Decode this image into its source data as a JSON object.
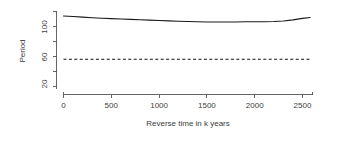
{
  "chart_data": {
    "type": "line",
    "title": "",
    "xlabel": "Reverse time in k years",
    "ylabel": "Period",
    "xlim": [
      -60,
      2620
    ],
    "ylim": [
      17,
      150
    ],
    "yscale": "log",
    "grid": false,
    "legend": "none",
    "xticks": [
      0,
      500,
      1000,
      1500,
      2000,
      2500
    ],
    "xticklabels": [
      "0",
      "500",
      "1000",
      "1500",
      "2000",
      "2500"
    ],
    "yticks": [
      20,
      40,
      60,
      80,
      100,
      140
    ],
    "yticklabels": [
      "20",
      "",
      "60",
      "",
      "100",
      ""
    ],
    "ylabeled_ticks": [
      {
        "value": 100,
        "label": "100"
      },
      {
        "value": 60,
        "label": "60"
      },
      {
        "value": 20,
        "label": "20"
      }
    ],
    "series": [
      {
        "name": "period-curve",
        "style": "solid",
        "x": [
          0,
          100,
          200,
          300,
          400,
          500,
          600,
          700,
          800,
          900,
          1000,
          1100,
          1200,
          1300,
          1400,
          1500,
          1600,
          1700,
          1800,
          1900,
          2000,
          2100,
          2200,
          2300,
          2400,
          2500,
          2580
        ],
        "y": [
          126.5,
          125.0,
          123.0,
          121.2,
          119.6,
          118.2,
          117.0,
          115.9,
          114.8,
          113.7,
          112.6,
          111.5,
          110.5,
          109.6,
          108.9,
          108.4,
          108.2,
          108.3,
          108.5,
          108.7,
          108.8,
          108.9,
          109.4,
          111.0,
          114.5,
          119.0,
          121.5
        ]
      },
      {
        "name": "threshold-line",
        "style": "dashed",
        "x": [
          0,
          2580
        ],
        "y": [
          41.0,
          41.0
        ]
      }
    ]
  },
  "axes": {
    "y_title": "Period",
    "x_title": "Reverse time in k years"
  }
}
